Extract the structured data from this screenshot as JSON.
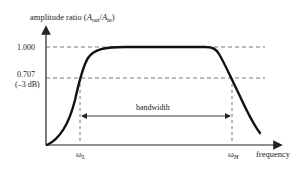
{
  "diagram": {
    "y_axis_label": {
      "prefix": "amplitude ratio (",
      "A_out": "A",
      "out_sub": "out",
      "slash": "/",
      "A_in": "A",
      "in_sub": "in",
      "suffix": ")"
    },
    "x_axis_label": "frequency",
    "levels": [
      {
        "value": "1.000",
        "note": ""
      },
      {
        "value": "0.707",
        "note": "(–3 dB)"
      }
    ],
    "cutoffs": {
      "low": {
        "symbol": "ω",
        "sub": "L"
      },
      "high": {
        "symbol": "ω",
        "sub": "H"
      }
    },
    "bandwidth_label": "bandwidth",
    "colors": {
      "curve": "#111111",
      "axis": "#222222",
      "dashed": "#555555"
    }
  }
}
